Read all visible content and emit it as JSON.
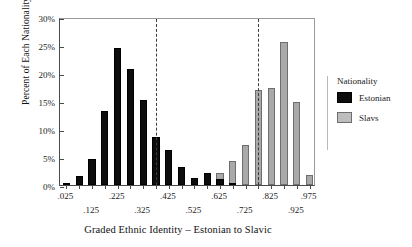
{
  "chart_data": {
    "type": "bar",
    "title": "",
    "xlabel": "Graded Ethnic Identity – Estonian to Slavic",
    "ylabel": "Percent of Each Nationality",
    "ylim": [
      0,
      30
    ],
    "yticks": [
      "0%",
      "5%",
      "10%",
      "15%",
      "20%",
      "25%",
      "30%"
    ],
    "ytick_values": [
      0,
      5,
      10,
      15,
      20,
      25,
      30
    ],
    "xlim": [
      0,
      1
    ],
    "xticks_row_upper": [
      ".025",
      ".225",
      ".425",
      ".625",
      ".825",
      ".975"
    ],
    "xticks_row_lower": [
      ".125",
      ".325",
      ".525",
      ".725",
      ".925"
    ],
    "xtick_values_upper": [
      0.025,
      0.225,
      0.425,
      0.625,
      0.825,
      0.975
    ],
    "xtick_values_lower": [
      0.125,
      0.325,
      0.525,
      0.725,
      0.925
    ],
    "grid": false,
    "legend_position": "right",
    "legend_title": "Nationality",
    "reference_lines": [
      {
        "name": "estonian-cutline",
        "x": 0.375,
        "style": "dashed"
      },
      {
        "name": "slavic-cutline",
        "x": 0.775,
        "style": "dashed"
      }
    ],
    "x": [
      0.025,
      0.075,
      0.125,
      0.175,
      0.225,
      0.275,
      0.325,
      0.375,
      0.425,
      0.475,
      0.525,
      0.575,
      0.625,
      0.675,
      0.725,
      0.775,
      0.825,
      0.875,
      0.925,
      0.975
    ],
    "series": [
      {
        "name": "Estonian",
        "color": "#0d0d0d",
        "values": [
          0.4,
          1.6,
          4.6,
          13.2,
          24.5,
          20.8,
          15.1,
          8.6,
          6.2,
          3.3,
          1.3,
          2.1,
          1.0,
          0.4,
          0.0,
          0.0,
          0.0,
          0.0,
          0.0,
          0.0
        ]
      },
      {
        "name": "Slavs",
        "color": "#a9a9a9",
        "values": [
          0.0,
          0.0,
          0.0,
          0.0,
          0.0,
          0.0,
          0.0,
          0.0,
          0.3,
          0.6,
          1.2,
          1.4,
          2.2,
          4.3,
          7.2,
          17.0,
          17.4,
          25.5,
          14.9,
          1.7
        ]
      }
    ]
  },
  "legend": {
    "title": "Nationality",
    "items": [
      {
        "label": "Estonian",
        "color": "#0d0d0d"
      },
      {
        "label": "Slavs",
        "color": "#bdbdbd"
      }
    ]
  }
}
